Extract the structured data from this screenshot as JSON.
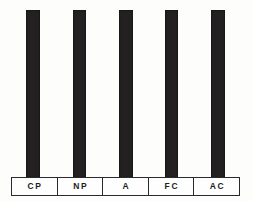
{
  "chart_data": {
    "type": "bar",
    "title": "",
    "subtitle": "",
    "xlabel": "",
    "ylabel": "",
    "categories": [
      "CP",
      "NP",
      "A",
      "FC",
      "AC"
    ],
    "values": [
      100,
      100,
      100,
      100,
      100
    ],
    "ylim": [
      0,
      100
    ],
    "grid": false,
    "legend": null,
    "annotations": [],
    "bar_color": "#222020",
    "background_color": "#fdfdfc",
    "axis_line_color": "#2a2a2a"
  },
  "chart": {
    "bars": [
      {
        "label": "CP",
        "value": 100,
        "left_px": 26,
        "width_px": 14
      },
      {
        "label": "NP",
        "value": 100,
        "left_px": 73,
        "width_px": 13
      },
      {
        "label": "A",
        "value": 100,
        "left_px": 119,
        "width_px": 14
      },
      {
        "label": "FC",
        "value": 100,
        "left_px": 165,
        "width_px": 13
      },
      {
        "label": "AC",
        "value": 100,
        "left_px": 211,
        "width_px": 14
      }
    ]
  }
}
